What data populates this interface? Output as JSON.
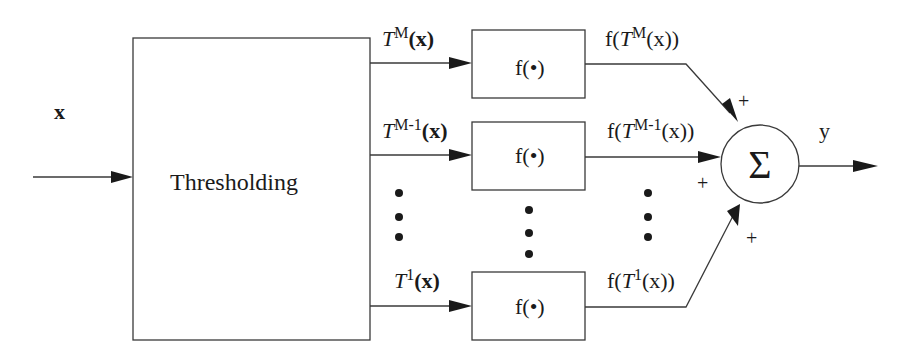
{
  "diagram": {
    "input_label": "x",
    "threshold_block": {
      "label": "Thresholding"
    },
    "channels": [
      {
        "id": "M",
        "input_label_base": "T",
        "input_label_sup": "M",
        "input_label_arg": "(x)",
        "block_label": "f(•)",
        "output_label_pre": "f(",
        "output_label_base": "T",
        "output_label_sup": "M",
        "output_label_arg": "(x))",
        "sign": "+"
      },
      {
        "id": "M-1",
        "input_label_base": "T",
        "input_label_sup": "M-1",
        "input_label_arg": "(x)",
        "block_label": "f(•)",
        "output_label_pre": "f(",
        "output_label_base": "T",
        "output_label_sup": "M-1",
        "output_label_arg": "(x))",
        "sign": "+"
      },
      {
        "id": "1",
        "input_label_base": "T",
        "input_label_sup": "1",
        "input_label_arg": "(x)",
        "block_label": "f(•)",
        "output_label_pre": "f(",
        "output_label_base": "T",
        "output_label_sup": "1",
        "output_label_arg": "(x))",
        "sign": "+"
      }
    ],
    "summer": {
      "symbol": "Σ"
    },
    "output_label": "y",
    "colors": {
      "stroke": "#3a3a3a",
      "text": "#1a1a1a",
      "background": "#ffffff"
    }
  }
}
